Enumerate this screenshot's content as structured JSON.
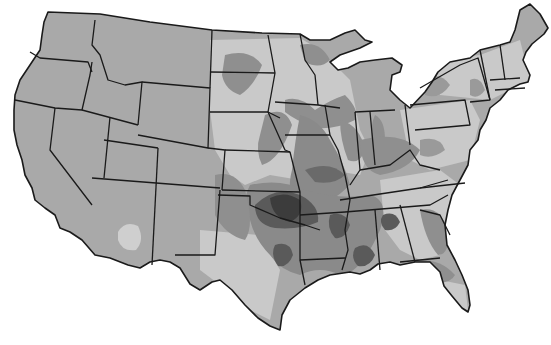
{
  "map": {
    "title": "",
    "region": "Contiguous United States",
    "style": "grayscale choropleth",
    "shades": {
      "background": "#ffffff",
      "base": "#a9a9a9",
      "light": "#c9c9c9",
      "medium": "#8a8a8a",
      "dark": "#5a5a5a",
      "darkest": "#3c3c3c",
      "border": "#1a1a1a"
    },
    "legend": []
  }
}
